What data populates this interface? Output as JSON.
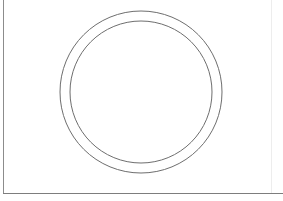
{
  "canvas": {
    "width": 283,
    "height": 201,
    "background_color": "#ffffff",
    "title": "Concentric Circles Drawing"
  },
  "frame": {
    "left_rule": {
      "name": "left-border-line",
      "x": 3.5,
      "y1": 0,
      "y2": 193,
      "color": "#8c8c8c",
      "width": 1.2
    },
    "bottom_rule": {
      "name": "bottom-border-line",
      "y": 193.5,
      "x1": 3,
      "x2": 283,
      "color": "#7d7d7d",
      "width": 1.4
    },
    "right_rule": {
      "name": "right-border-line",
      "x": 271,
      "y1": 0,
      "y2": 193,
      "color": "#ededed",
      "width": 1
    }
  },
  "shapes": {
    "outer_circle": {
      "name": "outer-circle",
      "cx": 141,
      "cy": 92,
      "r": 81,
      "stroke_color": "#6e6e6e",
      "stroke_width": 1,
      "fill": "none"
    },
    "inner_circle": {
      "name": "inner-circle",
      "cx": 141,
      "cy": 92,
      "r": 71,
      "stroke_color": "#6e6e6e",
      "stroke_width": 1,
      "fill": "none"
    },
    "ring_gap": 10
  },
  "labels": {
    "caption": ""
  }
}
